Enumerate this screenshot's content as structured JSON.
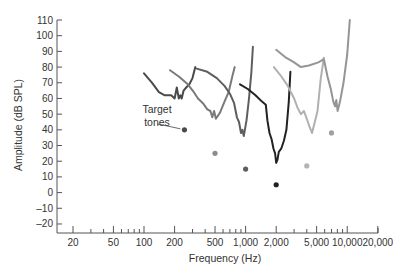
{
  "chart_data": {
    "type": "line",
    "title": "",
    "xlabel": "Frequency (Hz)",
    "ylabel": "Amplitude (dB SPL)",
    "xscale": "log",
    "xlim": [
      16,
      22000
    ],
    "ylim": [
      -25,
      112
    ],
    "grid": false,
    "legend": null,
    "x_ticks": [
      20,
      50,
      100,
      200,
      500,
      1000,
      2000,
      5000,
      10000,
      20000
    ],
    "x_tick_labels": [
      "20",
      "50",
      "100",
      "200",
      "500",
      "1,000",
      "2,000",
      "5,000",
      "10,000",
      "20,000"
    ],
    "y_ticks": [
      110,
      100,
      90,
      80,
      70,
      60,
      50,
      40,
      30,
      20,
      10,
      0,
      -10,
      -20
    ],
    "y_tick_labels": [
      "110",
      "100",
      "90",
      "80",
      "70",
      "60",
      "50",
      "40",
      "30",
      "20",
      "10",
      "0",
      "–10",
      "–20"
    ],
    "annotations": [
      {
        "text": [
          "Target",
          "tones"
        ],
        "points_to_series": "tone-250"
      }
    ],
    "target_tones": [
      {
        "name": "tone-250",
        "freq": 250,
        "db": 40,
        "color": "#4a4a4a"
      },
      {
        "name": "tone-500",
        "freq": 500,
        "db": 25,
        "color": "#8c8c8c"
      },
      {
        "name": "tone-1000",
        "freq": 1000,
        "db": 15,
        "color": "#5e5e5e"
      },
      {
        "name": "tone-2000",
        "freq": 2000,
        "db": 5,
        "color": "#222222"
      },
      {
        "name": "tone-4000",
        "freq": 4000,
        "db": 17,
        "color": "#b4b4b4"
      },
      {
        "name": "tone-7000",
        "freq": 7000,
        "db": 38,
        "color": "#a0a0a0"
      }
    ],
    "series": [
      {
        "name": "tuning-curve-250Hz",
        "color": "#4a4a4a",
        "points": [
          [
            100,
            76
          ],
          [
            120,
            70
          ],
          [
            140,
            64
          ],
          [
            160,
            62
          ],
          [
            185,
            62
          ],
          [
            200,
            60
          ],
          [
            210,
            67
          ],
          [
            220,
            60
          ],
          [
            228,
            62
          ],
          [
            235,
            60
          ],
          [
            245,
            65
          ],
          [
            260,
            67
          ],
          [
            280,
            69
          ],
          [
            300,
            73
          ],
          [
            320,
            80
          ]
        ]
      },
      {
        "name": "tuning-curve-500Hz",
        "color": "#7a7a7a",
        "points": [
          [
            180,
            78
          ],
          [
            220,
            74
          ],
          [
            270,
            69
          ],
          [
            310,
            64
          ],
          [
            340,
            60
          ],
          [
            380,
            57
          ],
          [
            420,
            53
          ],
          [
            450,
            52
          ],
          [
            470,
            48
          ],
          [
            490,
            52
          ],
          [
            510,
            47
          ],
          [
            560,
            51
          ],
          [
            620,
            58
          ],
          [
            680,
            64
          ],
          [
            740,
            74
          ],
          [
            780,
            80
          ]
        ]
      },
      {
        "name": "tuning-curve-1000Hz",
        "color": "#5e5e5e",
        "points": [
          [
            330,
            79
          ],
          [
            420,
            77
          ],
          [
            520,
            73
          ],
          [
            620,
            68
          ],
          [
            700,
            63
          ],
          [
            770,
            57
          ],
          [
            820,
            48
          ],
          [
            860,
            45
          ],
          [
            900,
            38
          ],
          [
            930,
            40
          ],
          [
            960,
            36
          ],
          [
            1020,
            46
          ],
          [
            1080,
            60
          ],
          [
            1140,
            77
          ],
          [
            1180,
            93
          ]
        ]
      },
      {
        "name": "tuning-curve-2000Hz",
        "color": "#222222",
        "points": [
          [
            880,
            69
          ],
          [
            1050,
            66
          ],
          [
            1250,
            62
          ],
          [
            1450,
            58
          ],
          [
            1580,
            56
          ],
          [
            1640,
            46
          ],
          [
            1720,
            38
          ],
          [
            1800,
            34
          ],
          [
            1880,
            28
          ],
          [
            1950,
            25
          ],
          [
            2000,
            19
          ],
          [
            2060,
            21
          ],
          [
            2120,
            26
          ],
          [
            2240,
            28
          ],
          [
            2380,
            33
          ],
          [
            2520,
            40
          ],
          [
            2660,
            58
          ],
          [
            2760,
            77
          ]
        ]
      },
      {
        "name": "tuning-curve-4000Hz",
        "color": "#b0b0b0",
        "points": [
          [
            1900,
            80
          ],
          [
            2250,
            74
          ],
          [
            2600,
            68
          ],
          [
            3000,
            60
          ],
          [
            3250,
            54
          ],
          [
            3500,
            50
          ],
          [
            3750,
            52
          ],
          [
            4000,
            47
          ],
          [
            4250,
            42
          ],
          [
            4500,
            38
          ],
          [
            4800,
            45
          ],
          [
            5100,
            52
          ],
          [
            5500,
            73
          ],
          [
            5900,
            86
          ]
        ]
      },
      {
        "name": "tuning-curve-7000Hz",
        "color": "#959595",
        "points": [
          [
            2000,
            91
          ],
          [
            2500,
            86
          ],
          [
            3000,
            83
          ],
          [
            3500,
            80
          ],
          [
            4200,
            81
          ],
          [
            5200,
            83
          ],
          [
            5900,
            85
          ],
          [
            6400,
            74
          ],
          [
            6900,
            66
          ],
          [
            7300,
            58
          ],
          [
            7600,
            55
          ],
          [
            7800,
            59
          ],
          [
            8050,
            52
          ],
          [
            8500,
            58
          ],
          [
            9200,
            70
          ],
          [
            10000,
            88
          ],
          [
            10600,
            110
          ]
        ]
      }
    ]
  }
}
